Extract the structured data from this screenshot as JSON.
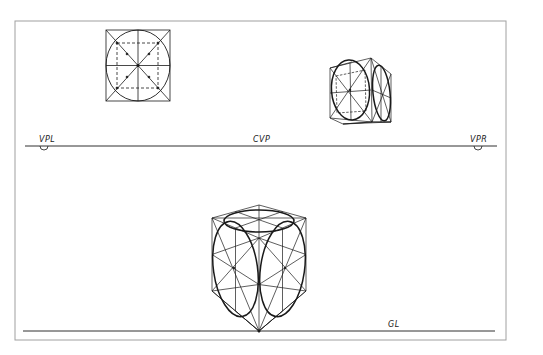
{
  "figure": {
    "colors": {
      "ink": "#1a1a1a",
      "frame": "#9a9a9a",
      "background": "#ffffff"
    }
  },
  "labels": {
    "vpl": "VPL",
    "cvp": "CVP",
    "vpr": "VPR",
    "gl": "GL"
  },
  "elements": {
    "horizon_line": {
      "y": 146,
      "x1": 25,
      "x2": 497
    },
    "ground_line": {
      "y": 331,
      "x1": 23,
      "x2": 495
    },
    "frame": {
      "x": 15,
      "y": 21,
      "w": 491,
      "h": 319
    },
    "orthographic_square": {
      "x": 106,
      "y": 30,
      "size": 64,
      "inner_dashed": [
        117,
        43,
        158,
        88
      ]
    },
    "small_cube": "two-point perspective cube above horizon with ellipses on visible faces",
    "large_cube": "two-point perspective cube below horizon resting on ground line with ellipses on three faces"
  }
}
